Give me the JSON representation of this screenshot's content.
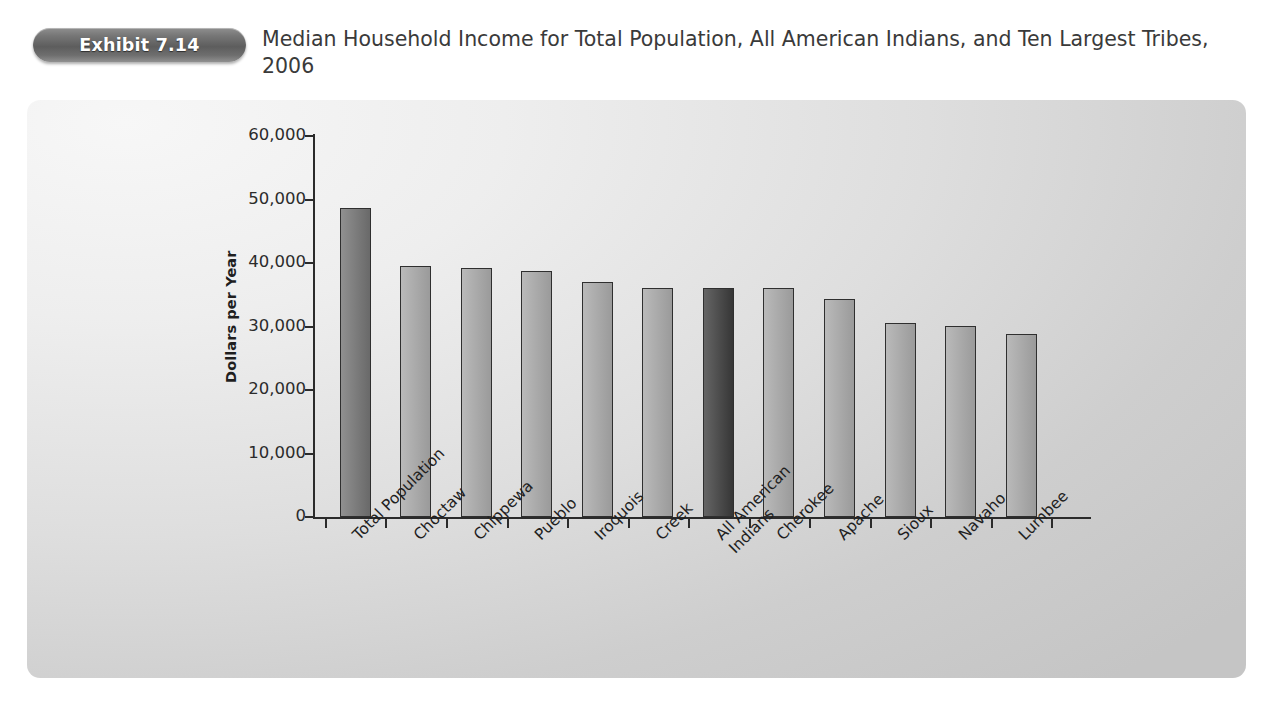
{
  "header": {
    "badge_label": "Exhibit 7.14",
    "title": "Median Household Income for Total Population, All American Indians, and Ten Largest Tribes, 2006"
  },
  "colors": {
    "badge_gray": "#6e6e6e",
    "panel_bg": "#e2e2e2",
    "bar_default": "#a6a6a6",
    "bar_total_population": "#717171",
    "bar_highlight": "#3a3a3a",
    "axis": "#2b2b2b",
    "text": "#1f1f1f"
  },
  "chart_data": {
    "type": "bar",
    "title": "Median Household Income for Total Population, All American Indians, and Ten Largest Tribes, 2006",
    "xlabel": "",
    "ylabel": "Dollars per Year",
    "ylim": [
      0,
      60000
    ],
    "ytick_labels": [
      "60,000",
      "50,000",
      "40,000",
      "30,000",
      "20,000",
      "10,000",
      "0"
    ],
    "ytick_values": [
      60000,
      50000,
      40000,
      30000,
      20000,
      10000,
      0
    ],
    "grid": false,
    "legend": "none",
    "categories": [
      "Total Population",
      "Choctaw",
      "Chippewa",
      "Pueblo",
      "Iroquois",
      "Creek",
      "All American Indians",
      "Cherokee",
      "Apache",
      "Sioux",
      "Navaho",
      "Lumbee"
    ],
    "values": [
      48700,
      39600,
      39200,
      38800,
      37000,
      36100,
      36100,
      36000,
      34400,
      30500,
      30100,
      28800
    ],
    "bar_shades": [
      "#717171",
      "#a6a6a6",
      "#a6a6a6",
      "#a6a6a6",
      "#a6a6a6",
      "#a6a6a6",
      "#3a3a3a",
      "#a6a6a6",
      "#a6a6a6",
      "#a6a6a6",
      "#a6a6a6",
      "#a6a6a6"
    ],
    "label_lines": [
      [
        "Total Population"
      ],
      [
        "Choctaw"
      ],
      [
        "Chippewa"
      ],
      [
        "Pueblo"
      ],
      [
        "Iroquois"
      ],
      [
        "Creek"
      ],
      [
        "All American",
        "Indians"
      ],
      [
        "Cherokee"
      ],
      [
        "Apache"
      ],
      [
        "Sioux"
      ],
      [
        "Navaho"
      ],
      [
        "Lumbee"
      ]
    ]
  }
}
